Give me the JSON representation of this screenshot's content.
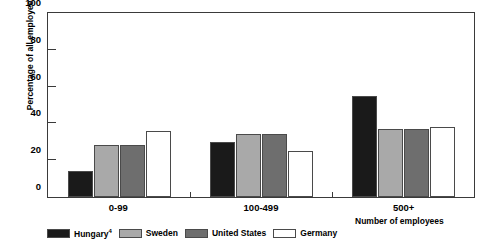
{
  "chart_data": {
    "type": "bar",
    "title": "",
    "xlabel": "Number of employees",
    "ylabel": "Percentage of all employees",
    "categories": [
      "0-99",
      "100-499",
      "500+"
    ],
    "ylim": [
      0,
      100
    ],
    "yticks": [
      0,
      20,
      40,
      60,
      80,
      100
    ],
    "grid": false,
    "legend_position": "bottom-left",
    "series": [
      {
        "name": "Hungary",
        "footnote": "4",
        "color": "#1a1a1a",
        "values": [
          14,
          30,
          55
        ]
      },
      {
        "name": "Sweden",
        "footnote": "",
        "color": "#a9a9a9",
        "values": [
          28,
          34,
          37
        ]
      },
      {
        "name": "United States",
        "footnote": "",
        "color": "#6e6e6e",
        "values": [
          28,
          34,
          37
        ]
      },
      {
        "name": "Germany",
        "footnote": "",
        "color": "#ffffff",
        "values": [
          36,
          25,
          38
        ]
      }
    ]
  },
  "axis": {
    "y_label": "Percentage of all employees",
    "x_label": "Number of employees",
    "y_ticks": [
      "0",
      "20",
      "40",
      "60",
      "80",
      "100"
    ],
    "x_categories": [
      "0-99",
      "100-499",
      "500+"
    ]
  },
  "legend": {
    "items": [
      {
        "label": "Hungary",
        "footnote": "4"
      },
      {
        "label": "Sweden",
        "footnote": ""
      },
      {
        "label": "United States",
        "footnote": ""
      },
      {
        "label": "Germany",
        "footnote": ""
      }
    ]
  },
  "colors": {
    "hungary": "#1a1a1a",
    "sweden": "#a9a9a9",
    "united_states": "#6e6e6e",
    "germany": "#ffffff",
    "axis": "#3a3a3a",
    "bar_outline": "#4a4a4a"
  }
}
